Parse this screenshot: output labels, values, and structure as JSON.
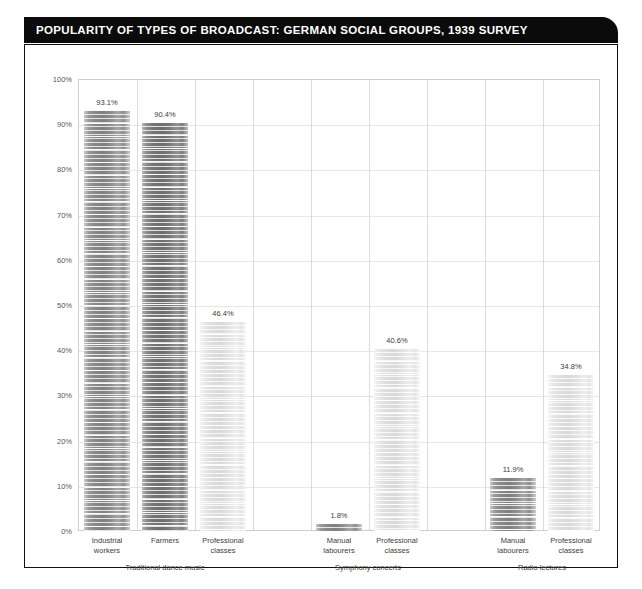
{
  "title": "POPULARITY OF TYPES OF BROADCAST: GERMAN SOCIAL GROUPS, 1939 SURVEY",
  "colors": {
    "title_bar_background": "#0b0b0b",
    "title_text": "#ffffff",
    "frame_border": "#111111",
    "plot_border": "#cfcfcf",
    "gridline": "#e6e6e6",
    "column_divider": "#dcdcdc",
    "axis_text": "#58585a",
    "label_text": "#3d3d3d",
    "bar_dark": "#7f7f7f",
    "bar_darker": "#6d6d6d",
    "bar_light": "#dddddd"
  },
  "chart_data": {
    "type": "bar",
    "title": "POPULARITY OF TYPES OF BROADCAST: GERMAN SOCIAL GROUPS, 1939 SURVEY",
    "xlabel": "",
    "ylabel": "",
    "ylim": [
      0,
      100
    ],
    "ytick_labels": [
      "0%",
      "10%",
      "20%",
      "30%",
      "40%",
      "50%",
      "60%",
      "70%",
      "80%",
      "90%",
      "100%"
    ],
    "ytick_values": [
      0,
      10,
      20,
      30,
      40,
      50,
      60,
      70,
      80,
      90,
      100
    ],
    "grid": true,
    "legend": "none",
    "value_label_suffix": "%",
    "groups": [
      {
        "name": "Traditional dance music",
        "bars": [
          {
            "category": "Industrial workers",
            "label_line1": "Industrial",
            "label_line2": "workers",
            "value": 93.1,
            "value_label": "93.1%",
            "tone": "dark"
          },
          {
            "category": "Farmers",
            "label_line1": "Farmers",
            "label_line2": "",
            "value": 90.4,
            "value_label": "90.4%",
            "tone": "darker"
          },
          {
            "category": "Professional classes",
            "label_line1": "Professional",
            "label_line2": "classes",
            "value": 46.4,
            "value_label": "46.4%",
            "tone": "light"
          }
        ]
      },
      {
        "name": "Symphony concerts",
        "bars": [
          {
            "category": "Manual labourers",
            "label_line1": "Manual",
            "label_line2": "labourers",
            "value": 1.8,
            "value_label": "1.8%",
            "tone": "dark"
          },
          {
            "category": "Professional classes",
            "label_line1": "Professional",
            "label_line2": "classes",
            "value": 40.6,
            "value_label": "40.6%",
            "tone": "light"
          }
        ]
      },
      {
        "name": "Radio lectures",
        "bars": [
          {
            "category": "Manual labourers",
            "label_line1": "Manual",
            "label_line2": "labourers",
            "value": 11.9,
            "value_label": "11.9%",
            "tone": "dark"
          },
          {
            "category": "Professional classes",
            "label_line1": "Professional",
            "label_line2": "classes",
            "value": 34.8,
            "value_label": "34.8%",
            "tone": "light"
          }
        ]
      }
    ]
  }
}
